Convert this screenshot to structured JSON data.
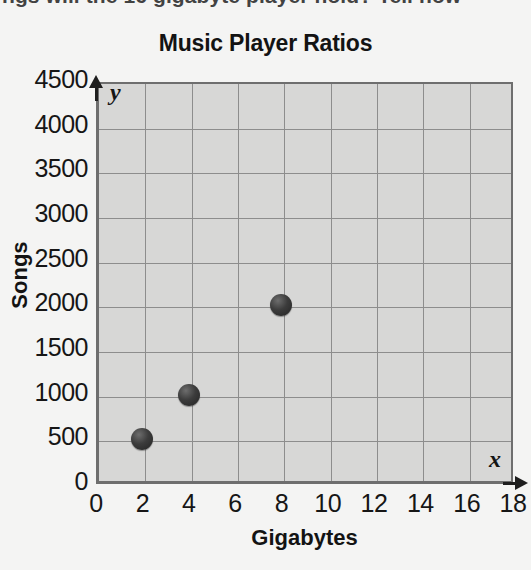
{
  "page": {
    "context_text": "ngs will the 16 gigabyte player hold? Tell how"
  },
  "chart_data": {
    "type": "scatter",
    "title": "Music Player Ratios",
    "xlabel": "Gigabytes",
    "ylabel": "Songs",
    "x_axis_variable": "x",
    "y_axis_variable": "y",
    "xlim": [
      0,
      18
    ],
    "ylim": [
      0,
      4500
    ],
    "xticks": [
      "0",
      "2",
      "4",
      "6",
      "8",
      "10",
      "12",
      "14",
      "16",
      "18"
    ],
    "yticks": [
      "0",
      "500",
      "1000",
      "1500",
      "2000",
      "2500",
      "3000",
      "3500",
      "4000",
      "4500"
    ],
    "xtick_values": [
      0,
      2,
      4,
      6,
      8,
      10,
      12,
      14,
      16,
      18
    ],
    "ytick_values": [
      0,
      500,
      1000,
      1500,
      2000,
      2500,
      3000,
      3500,
      4000,
      4500
    ],
    "grid": true,
    "legend": false,
    "points": [
      {
        "x": 2,
        "y": 500
      },
      {
        "x": 4,
        "y": 1000
      },
      {
        "x": 8,
        "y": 2000
      }
    ],
    "colors": {
      "plot_background": "#d7d7d6",
      "gridline": "#8d8d8d",
      "axis": "#1e1e1e",
      "marker": "#2c2c2c",
      "page_background": "#f4f4f3"
    }
  }
}
